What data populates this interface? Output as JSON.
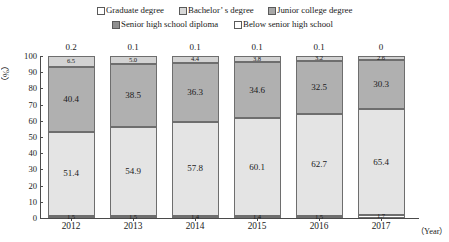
{
  "legend": {
    "row1": [
      {
        "key": "graduate",
        "label": "Graduate degree",
        "swatch": "sw-grad"
      },
      {
        "key": "bachelor",
        "label": "Bachelor’ s degree",
        "swatch": "sw-bach"
      },
      {
        "key": "junior",
        "label": "Junior college degree",
        "swatch": "sw-jc"
      }
    ],
    "row2": [
      {
        "key": "senior",
        "label": "Senior high school diploma",
        "swatch": "sw-shs"
      },
      {
        "key": "below",
        "label": "Below senior high school",
        "swatch": "sw-below"
      }
    ]
  },
  "axes": {
    "ylabel": "（%）",
    "xlabel": "（Year）",
    "yticks": [
      "0",
      "10",
      "20",
      "30",
      "40",
      "50",
      "60",
      "70",
      "80",
      "90",
      "100"
    ],
    "xticks": [
      "2012",
      "2013",
      "2014",
      "2015",
      "2016",
      "2017"
    ]
  },
  "chart_data": {
    "type": "bar",
    "subtype": "stacked-100",
    "title": "",
    "xlabel": "（Year）",
    "ylabel": "（%）",
    "ylim": [
      0,
      100
    ],
    "ytick_step": 10,
    "grid": false,
    "legend_position": "top",
    "categories": [
      "2012",
      "2013",
      "2014",
      "2015",
      "2016",
      "2017"
    ],
    "series": [
      {
        "name": "Graduate degree",
        "values": [
          0.2,
          0.1,
          0.1,
          0.1,
          0.1,
          0
        ],
        "labels": [
          "0.2",
          "0.1",
          "0.1",
          "0.1",
          "0.1",
          "0"
        ],
        "label_position": "above-bar"
      },
      {
        "name": "Bachelor’ s degree",
        "values": [
          6.5,
          5.0,
          4.4,
          3.8,
          3.2,
          2.6
        ],
        "labels": [
          "6.5",
          "5.0",
          "4.4",
          "3.8",
          "3.2",
          "2.6"
        ],
        "label_position": "inside"
      },
      {
        "name": "Junior college degree",
        "values": [
          40.4,
          38.5,
          36.3,
          34.6,
          32.5,
          30.3
        ],
        "labels": [
          "40.4",
          "38.5",
          "36.3",
          "34.6",
          "32.5",
          "30.3"
        ],
        "label_position": "inside"
      },
      {
        "name": "Senior high school diploma",
        "values": [
          51.4,
          54.9,
          57.8,
          60.1,
          62.7,
          65.4
        ],
        "labels": [
          "51.4",
          "54.9",
          "57.8",
          "60.1",
          "62.7",
          "65.4"
        ],
        "label_position": "inside"
      },
      {
        "name": "Below senior high school",
        "values": [
          1.5,
          1.5,
          1.4,
          1.4,
          1.5,
          1.7
        ],
        "labels": [
          "1.5",
          "1.5",
          "1.4",
          "1.4",
          "1.5",
          "1.7"
        ],
        "label_position": "inside"
      }
    ]
  }
}
